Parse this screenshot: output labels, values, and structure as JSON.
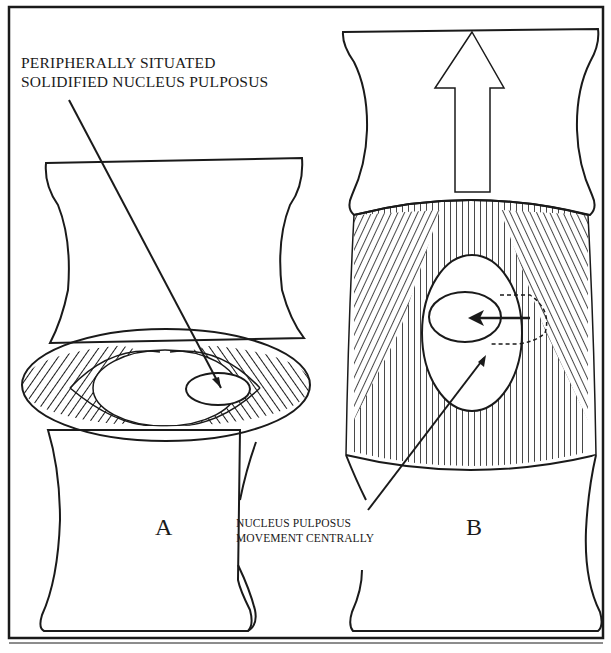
{
  "figure": {
    "panels": [
      {
        "id": "A",
        "letter": "A",
        "description": "Intervertebral disc with annulus fibrosus lamellae and peripherally situated nucleus pulposus"
      },
      {
        "id": "B",
        "letter": "B",
        "description": "Distracted intervertebral disc with upward arrow; nucleus pulposus moves centrally"
      }
    ],
    "annotations": {
      "top_label_line1": "PERIPHERALLY SITUATED",
      "top_label_line2": "SOLIDIFIED NUCLEUS PULPOSUS",
      "bottom_label_line1": "NUCLEUS PULPOSUS",
      "bottom_label_line2": "MOVEMENT CENTRALLY"
    },
    "caption_cut_off": "...",
    "colors": {
      "ink": "#1a1a1a",
      "paper": "#ffffff"
    }
  }
}
